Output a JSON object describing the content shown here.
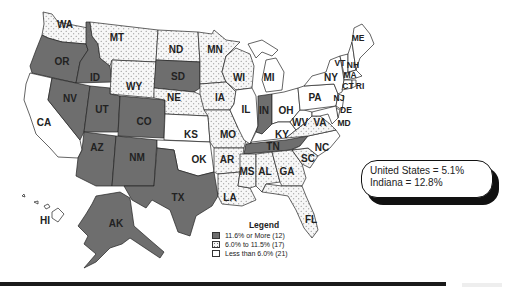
{
  "map": {
    "colors": {
      "high": "#6e6e6e",
      "mid_pattern": "dotted",
      "mid_bg": "#f4f4f4",
      "low": "#ffffff"
    },
    "states": {
      "WA": {
        "label": "WA",
        "category": "mid"
      },
      "OR": {
        "label": "OR",
        "category": "high"
      },
      "CA": {
        "label": "CA",
        "category": "low"
      },
      "ID": {
        "label": "ID",
        "category": "high"
      },
      "NV": {
        "label": "NV",
        "category": "high"
      },
      "MT": {
        "label": "MT",
        "category": "mid"
      },
      "WY": {
        "label": "WY",
        "category": "mid"
      },
      "UT": {
        "label": "UT",
        "category": "high"
      },
      "CO": {
        "label": "CO",
        "category": "high"
      },
      "AZ": {
        "label": "AZ",
        "category": "high"
      },
      "NM": {
        "label": "NM",
        "category": "high"
      },
      "ND": {
        "label": "ND",
        "category": "mid"
      },
      "SD": {
        "label": "SD",
        "category": "high"
      },
      "NE": {
        "label": "NE",
        "category": "mid"
      },
      "KS": {
        "label": "KS",
        "category": "low"
      },
      "OK": {
        "label": "OK",
        "category": "low"
      },
      "TX": {
        "label": "TX",
        "category": "high"
      },
      "MN": {
        "label": "MN",
        "category": "mid"
      },
      "IA": {
        "label": "IA",
        "category": "mid"
      },
      "MO": {
        "label": "MO",
        "category": "mid"
      },
      "AR": {
        "label": "AR",
        "category": "mid"
      },
      "LA": {
        "label": "LA",
        "category": "mid"
      },
      "WI": {
        "label": "WI",
        "category": "mid"
      },
      "IL": {
        "label": "IL",
        "category": "low"
      },
      "MI": {
        "label": "MI",
        "category": "low"
      },
      "IN": {
        "label": "IN",
        "category": "high"
      },
      "OH": {
        "label": "OH",
        "category": "low"
      },
      "KY": {
        "label": "KY",
        "category": "low"
      },
      "TN": {
        "label": "TN",
        "category": "high"
      },
      "MS": {
        "label": "MS",
        "category": "mid"
      },
      "AL": {
        "label": "AL",
        "category": "mid"
      },
      "GA": {
        "label": "GA",
        "category": "mid"
      },
      "FL": {
        "label": "FL",
        "category": "mid"
      },
      "SC": {
        "label": "SC",
        "category": "mid"
      },
      "NC": {
        "label": "NC",
        "category": "low"
      },
      "VA": {
        "label": "VA",
        "category": "mid"
      },
      "WV": {
        "label": "WV",
        "category": "low"
      },
      "PA": {
        "label": "PA",
        "category": "low"
      },
      "NY": {
        "label": "NY",
        "category": "low"
      },
      "NJ": {
        "label": "NJ",
        "category": "low"
      },
      "DE": {
        "label": "DE",
        "category": "low"
      },
      "MD": {
        "label": "MD",
        "category": "low"
      },
      "VT": {
        "label": "VT",
        "category": "low"
      },
      "NH": {
        "label": "NH",
        "category": "low"
      },
      "MA": {
        "label": "MA",
        "category": "low"
      },
      "CT": {
        "label": "CT",
        "category": "low"
      },
      "RI": {
        "label": "RI",
        "category": "low"
      },
      "ME": {
        "label": "ME",
        "category": "low"
      },
      "AK": {
        "label": "AK",
        "category": "high"
      },
      "HI": {
        "label": "HI",
        "category": "low"
      }
    }
  },
  "legend": {
    "title": "Legend",
    "items": [
      {
        "label": "11.6% or More (12)",
        "category": "high"
      },
      {
        "label": "6.0% to 11.5% (17)",
        "category": "mid"
      },
      {
        "label": "Less than 6.0% (21)",
        "category": "low"
      }
    ]
  },
  "callout": {
    "line1": "United States = 5.1%",
    "line2": "Indiana = 12.8%"
  }
}
